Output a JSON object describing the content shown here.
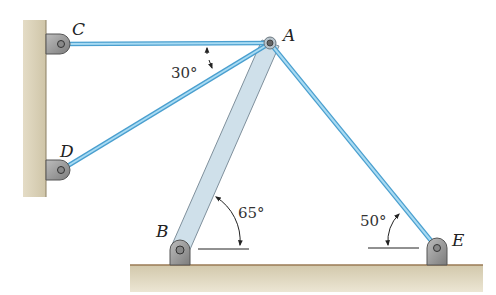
{
  "diagram": {
    "type": "statics-truss",
    "points": {
      "A": {
        "label": "A",
        "x": 270,
        "y": 43
      },
      "B": {
        "label": "B",
        "x": 180,
        "y": 250
      },
      "C": {
        "label": "C",
        "x": 61,
        "y": 44
      },
      "D": {
        "label": "D",
        "x": 61,
        "y": 170
      },
      "E": {
        "label": "E",
        "x": 437,
        "y": 248
      }
    },
    "members": [
      {
        "name": "cable-AC",
        "from": "A",
        "to": "C",
        "kind": "cable"
      },
      {
        "name": "cable-AD",
        "from": "A",
        "to": "D",
        "kind": "cable"
      },
      {
        "name": "cable-AE",
        "from": "A",
        "to": "E",
        "kind": "cable"
      },
      {
        "name": "strut-AB",
        "from": "A",
        "to": "B",
        "kind": "strut"
      }
    ],
    "angles": {
      "cd": {
        "label": "30°"
      },
      "ab": {
        "label": "65°"
      },
      "ae": {
        "label": "50°"
      }
    },
    "colors": {
      "cable": "#7cc3e8",
      "cable_edge": "#4a9fcf",
      "strut": "#c9dbe6",
      "strut_edge": "#8a9aa6",
      "wall": "#d6cdb4",
      "bracket": "#9a9a9a"
    }
  }
}
